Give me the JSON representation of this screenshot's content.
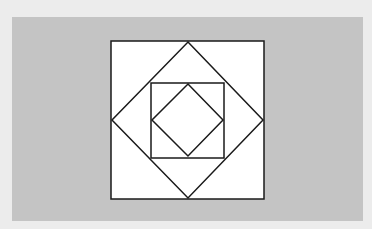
{
  "diagram": {
    "background_color": "#ececec",
    "panel_color": "#c4c4c4",
    "stroke_color": "#1a1a1a",
    "fill_color": "#ffffff",
    "shapes": [
      {
        "name": "outer-square",
        "type": "square",
        "points": [
          [
            111,
            41
          ],
          [
            264,
            41
          ],
          [
            264,
            199
          ],
          [
            111,
            199
          ]
        ]
      },
      {
        "name": "outer-diamond",
        "type": "diamond",
        "points": [
          [
            188,
            42
          ],
          [
            263,
            120
          ],
          [
            188,
            198
          ],
          [
            112,
            120
          ]
        ]
      },
      {
        "name": "inner-square",
        "type": "square",
        "points": [
          [
            151,
            83
          ],
          [
            224,
            83
          ],
          [
            224,
            158
          ],
          [
            151,
            158
          ]
        ]
      },
      {
        "name": "inner-diamond",
        "type": "diamond",
        "points": [
          [
            188,
            84
          ],
          [
            223,
            120
          ],
          [
            188,
            156
          ],
          [
            152,
            120
          ]
        ]
      }
    ]
  }
}
